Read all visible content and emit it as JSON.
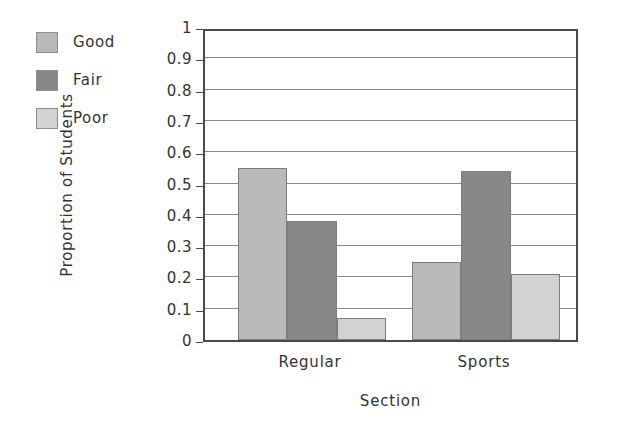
{
  "chart_data": {
    "type": "bar",
    "title": "",
    "xlabel": "Section",
    "ylabel": "Proportion of Students",
    "categories": [
      "Regular",
      "Sports"
    ],
    "series": [
      {
        "name": "Good",
        "values": [
          0.55,
          0.25
        ],
        "color": "#b9b9b9"
      },
      {
        "name": "Fair",
        "values": [
          0.38,
          0.54
        ],
        "color": "#888888"
      },
      {
        "name": "Poor",
        "values": [
          0.07,
          0.21
        ],
        "color": "#d2d2d2"
      }
    ],
    "ylim": [
      0,
      1
    ],
    "ytick_labels": [
      "1",
      "0.9",
      "0.8",
      "0.7",
      "0.6",
      "0.5",
      "0.4",
      "0.3",
      "0.2",
      "0.1",
      "0"
    ],
    "ytick_values": [
      1,
      0.9,
      0.8,
      0.7,
      0.6,
      0.5,
      0.4,
      0.3,
      0.2,
      0.1,
      0
    ],
    "grid": true,
    "grid_axis": "y",
    "legend": {
      "position": "top-left-outside",
      "entries": [
        "Good",
        "Fair",
        "Poor"
      ]
    },
    "frame_color": "#4a4a4a",
    "grid_color": "#8a8a8a",
    "background": "#ffffff"
  },
  "legend": {
    "items": [
      {
        "label": "Good",
        "color": "#b9b9b9"
      },
      {
        "label": "Fair",
        "color": "#888888"
      },
      {
        "label": "Poor",
        "color": "#d2d2d2"
      }
    ]
  },
  "axes": {
    "y_title": "Proportion of Students",
    "x_title": "Section",
    "y_ticks": [
      "1",
      "0.9",
      "0.8",
      "0.7",
      "0.6",
      "0.5",
      "0.4",
      "0.3",
      "0.2",
      "0.1",
      "0"
    ],
    "x_ticks": [
      "Regular",
      "Sports"
    ]
  }
}
